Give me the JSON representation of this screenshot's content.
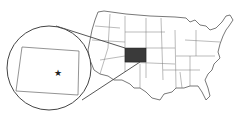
{
  "map": {
    "subject": "United States",
    "highlighted_state": "Colorado",
    "highlight_color": "#3a3a3a",
    "line_color": "#555555",
    "background": "#ffffff",
    "inset": {
      "shape": "circle",
      "content": "Colorado outline",
      "marker": "star",
      "marker_label": ""
    }
  }
}
